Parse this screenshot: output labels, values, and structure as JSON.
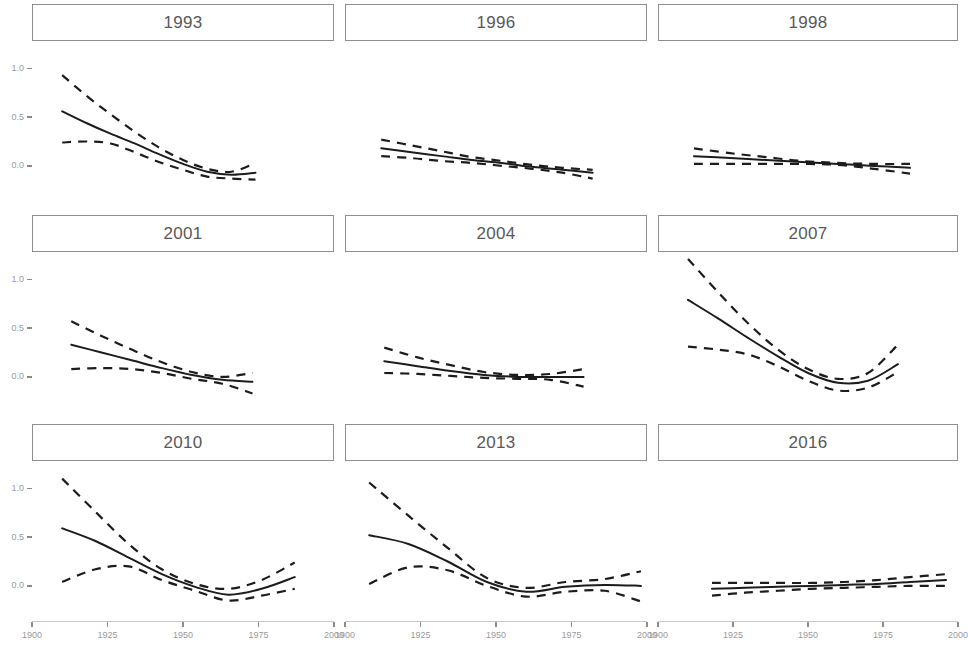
{
  "chart_data": {
    "type": "line",
    "title": "",
    "subtitle": "",
    "xlabel": "",
    "ylabel": "",
    "xlim": [
      1900,
      2000
    ],
    "ylim": [
      -0.35,
      1.25
    ],
    "grid": false,
    "legend": "none",
    "facet_layout": {
      "rows": 3,
      "cols": 3
    },
    "x_ticks": [
      1900,
      1925,
      1950,
      1975,
      2000
    ],
    "x_tick_labels": [
      "1900",
      "1925",
      "1950",
      "1975",
      "2000"
    ],
    "y_ticks": [
      0.0,
      0.5,
      1.0
    ],
    "y_tick_labels": [
      "0.0",
      "0.5",
      "1.0"
    ],
    "line_style": {
      "fit": "solid",
      "confidence_interval": "dashed"
    },
    "colors": {
      "fit_line": "#1c1c1c",
      "ci_line": "#1c1c1c",
      "strip_border": "#8e8e8e",
      "strip_text": "#595959",
      "axis_text": "#9a9a9a",
      "panel_background": "#ffffff"
    },
    "panels": [
      {
        "label": "1993",
        "row": 1,
        "col": 1,
        "x": [
          1910,
          1918,
          1926,
          1934,
          1942,
          1950,
          1958,
          1966,
          1974
        ],
        "fit": [
          0.56,
          0.44,
          0.33,
          0.23,
          0.12,
          0.02,
          -0.06,
          -0.09,
          -0.07
        ],
        "ci_upper": [
          0.93,
          0.72,
          0.53,
          0.35,
          0.19,
          0.06,
          -0.03,
          -0.06,
          0.03
        ],
        "ci_lower": [
          0.24,
          0.25,
          0.23,
          0.14,
          0.04,
          -0.04,
          -0.11,
          -0.13,
          -0.14
        ]
      },
      {
        "label": "1996",
        "row": 1,
        "col": 2,
        "x": [
          1912,
          1922,
          1932,
          1942,
          1952,
          1962,
          1972,
          1982
        ],
        "fit": [
          0.18,
          0.14,
          0.1,
          0.06,
          0.03,
          -0.01,
          -0.04,
          -0.07
        ],
        "ci_upper": [
          0.27,
          0.21,
          0.15,
          0.09,
          0.05,
          0.01,
          -0.02,
          -0.04
        ],
        "ci_lower": [
          0.1,
          0.08,
          0.05,
          0.03,
          0.0,
          -0.03,
          -0.07,
          -0.13
        ]
      },
      {
        "label": "1998",
        "row": 1,
        "col": 3,
        "x": [
          1912,
          1924,
          1936,
          1948,
          1960,
          1972,
          1984
        ],
        "fit": [
          0.1,
          0.08,
          0.06,
          0.04,
          0.02,
          0.0,
          -0.02
        ],
        "ci_upper": [
          0.18,
          0.13,
          0.09,
          0.05,
          0.03,
          0.02,
          0.02
        ],
        "ci_lower": [
          0.02,
          0.02,
          0.02,
          0.02,
          0.01,
          -0.03,
          -0.08
        ]
      },
      {
        "label": "2001",
        "row": 2,
        "col": 1,
        "x": [
          1913,
          1923,
          1933,
          1943,
          1953,
          1963,
          1973
        ],
        "fit": [
          0.33,
          0.25,
          0.17,
          0.09,
          0.02,
          -0.03,
          -0.05
        ],
        "ci_upper": [
          0.57,
          0.42,
          0.28,
          0.15,
          0.05,
          0.0,
          0.04
        ],
        "ci_lower": [
          0.08,
          0.09,
          0.08,
          0.04,
          -0.02,
          -0.07,
          -0.17
        ]
      },
      {
        "label": "2004",
        "row": 2,
        "col": 2,
        "x": [
          1913,
          1924,
          1935,
          1946,
          1957,
          1968,
          1979
        ],
        "fit": [
          0.16,
          0.11,
          0.06,
          0.02,
          0.0,
          0.0,
          0.0
        ],
        "ci_upper": [
          0.3,
          0.2,
          0.12,
          0.05,
          0.02,
          0.03,
          0.08
        ],
        "ci_lower": [
          0.04,
          0.03,
          0.01,
          -0.01,
          -0.02,
          -0.03,
          -0.1
        ]
      },
      {
        "label": "2007",
        "row": 2,
        "col": 3,
        "x": [
          1910,
          1920,
          1930,
          1940,
          1950,
          1960,
          1970,
          1980
        ],
        "fit": [
          0.79,
          0.6,
          0.4,
          0.21,
          0.04,
          -0.06,
          -0.04,
          0.13
        ],
        "ci_upper": [
          1.21,
          0.87,
          0.55,
          0.28,
          0.08,
          -0.02,
          0.04,
          0.33
        ],
        "ci_lower": [
          0.31,
          0.28,
          0.23,
          0.11,
          -0.04,
          -0.14,
          -0.11,
          0.05
        ]
      },
      {
        "label": "2010",
        "row": 3,
        "col": 1,
        "x": [
          1910,
          1921,
          1932,
          1943,
          1954,
          1965,
          1976,
          1987
        ],
        "fit": [
          0.59,
          0.46,
          0.29,
          0.12,
          -0.01,
          -0.09,
          -0.03,
          0.09
        ],
        "ci_upper": [
          1.1,
          0.76,
          0.43,
          0.17,
          0.02,
          -0.03,
          0.06,
          0.24
        ],
        "ci_lower": [
          0.04,
          0.17,
          0.2,
          0.06,
          -0.05,
          -0.15,
          -0.1,
          -0.03
        ]
      },
      {
        "label": "2013",
        "row": 3,
        "col": 2,
        "x": [
          1908,
          1921,
          1934,
          1947,
          1960,
          1973,
          1986,
          1998
        ],
        "fit": [
          0.52,
          0.43,
          0.25,
          0.04,
          -0.06,
          -0.01,
          0.01,
          0.0
        ],
        "ci_upper": [
          1.06,
          0.72,
          0.39,
          0.08,
          -0.02,
          0.04,
          0.07,
          0.15
        ],
        "ci_lower": [
          0.02,
          0.19,
          0.16,
          0.0,
          -0.11,
          -0.06,
          -0.05,
          -0.16
        ]
      },
      {
        "label": "2016",
        "row": 3,
        "col": 3,
        "x": [
          1918,
          1929,
          1940,
          1951,
          1962,
          1973,
          1984,
          1996
        ],
        "fit": [
          -0.03,
          -0.02,
          -0.01,
          0.0,
          0.01,
          0.02,
          0.04,
          0.06
        ],
        "ci_upper": [
          0.03,
          0.03,
          0.03,
          0.03,
          0.04,
          0.06,
          0.09,
          0.12
        ],
        "ci_lower": [
          -0.1,
          -0.07,
          -0.05,
          -0.03,
          -0.02,
          -0.01,
          0.0,
          0.0
        ]
      }
    ]
  },
  "axis": {
    "y_labels": [
      "1.0",
      "0.5",
      "0.0"
    ],
    "x_labels": [
      "1900",
      "1925",
      "1950",
      "1975",
      "2000"
    ]
  },
  "facets": {
    "r1c1": "1993",
    "r1c2": "1996",
    "r1c3": "1998",
    "r2c1": "2001",
    "r2c2": "2004",
    "r2c3": "2007",
    "r3c1": "2010",
    "r3c2": "2013",
    "r3c3": "2016"
  }
}
